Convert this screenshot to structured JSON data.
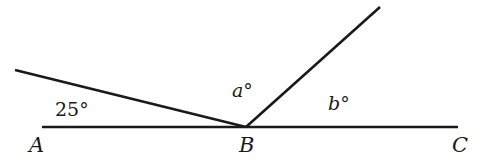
{
  "diagram": {
    "points": {
      "A": "A",
      "B": "B",
      "C": "C"
    },
    "angles": {
      "left": "25°",
      "a": "a°",
      "b": "b°"
    },
    "colors": {
      "line": "#1a1a1a",
      "background": "#ffffff"
    }
  }
}
